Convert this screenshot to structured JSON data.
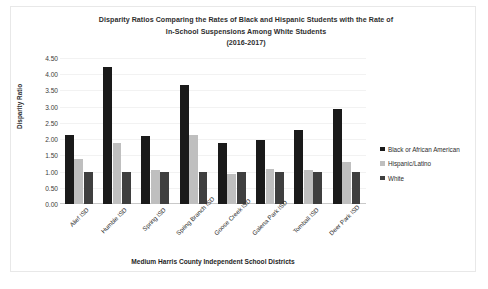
{
  "chart_data": {
    "type": "bar",
    "title": "Disparity Ratios Comparing the Rates of Black and Hispanic Students with the Rate of In-School Suspensions Among White Students (2016-2017)",
    "title_lines": [
      "Disparity Ratios Comparing the Rates of Black and Hispanic Students with the Rate of",
      "In-School Suspensions Among White Students",
      "(2016-2017)"
    ],
    "xlabel": "Medium Harris County Independent School Districts",
    "ylabel": "Disparity Ratio",
    "ylim": [
      0.0,
      4.5
    ],
    "ytick_step": 0.5,
    "ytick_labels": [
      "4.50",
      "4.00",
      "3.50",
      "3.00",
      "2.50",
      "2.00",
      "1.50",
      "1.00",
      "0.50",
      "0.00"
    ],
    "grid": true,
    "legend_position": "right",
    "categories": [
      "Alief ISD",
      "Humble ISD",
      "Spring ISD",
      "Spring Branch ISD",
      "Goose Creek ISD",
      "Galena Park ISD",
      "Tomball ISD",
      "Deer Park ISD"
    ],
    "series": [
      {
        "name": "Black or African American",
        "color": "#1a1a1a",
        "values": [
          2.13,
          4.22,
          2.1,
          3.68,
          1.87,
          1.97,
          2.29,
          2.92
        ]
      },
      {
        "name": "Hispanic/Latino",
        "color": "#bfbfbf",
        "values": [
          1.4,
          1.88,
          1.05,
          2.12,
          0.93,
          1.07,
          1.06,
          1.28
        ]
      },
      {
        "name": "White",
        "color": "#3f3f3f",
        "values": [
          1.0,
          1.0,
          1.0,
          1.0,
          0.99,
          0.99,
          0.98,
          0.98
        ]
      }
    ]
  }
}
